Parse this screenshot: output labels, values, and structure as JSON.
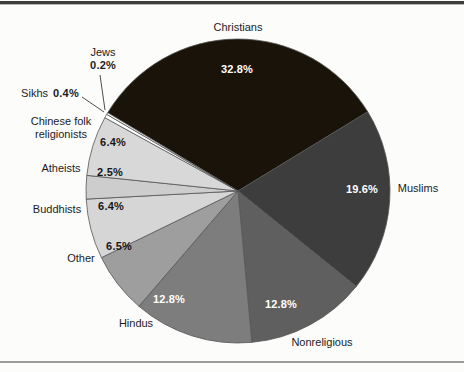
{
  "figure": {
    "background_color": "#fcfcfb",
    "top_rule_color": "#3d3d3d",
    "bottom_rule_color": "#9c9c9c"
  },
  "chart_data": {
    "type": "pie",
    "title": "",
    "unit": "percent",
    "direction": "clockwise",
    "start_angle_deg": -59,
    "legend_position": "outside-labels",
    "slices": [
      {
        "name": "Christians",
        "value": 32.8,
        "pct_label": "32.8%",
        "color": "#1a1309",
        "label_color": "#ffffff"
      },
      {
        "name": "Muslims",
        "value": 19.6,
        "pct_label": "19.6%",
        "color": "#3d3d3d",
        "label_color": "#ffffff"
      },
      {
        "name": "Nonreligious",
        "value": 12.8,
        "pct_label": "12.8%",
        "color": "#5f5f5f",
        "label_color": "#ffffff"
      },
      {
        "name": "Hindus",
        "value": 12.8,
        "pct_label": "12.8%",
        "color": "#7d7d7d",
        "label_color": "#ffffff"
      },
      {
        "name": "Other",
        "value": 6.5,
        "pct_label": "6.5%",
        "color": "#9e9e9e",
        "label_color": "#161616"
      },
      {
        "name": "Buddhists",
        "value": 6.4,
        "pct_label": "6.4%",
        "color": "#d6d6d6",
        "label_color": "#161616"
      },
      {
        "name": "Atheists",
        "value": 2.5,
        "pct_label": "2.5%",
        "color": "#cdcdcd",
        "label_color": "#161616"
      },
      {
        "name": "Chinese folk religionists",
        "value": 6.4,
        "pct_label": "6.4%",
        "color": "#d8d8d8",
        "label_color": "#161616"
      },
      {
        "name": "Sikhs",
        "value": 0.4,
        "pct_label": "0.4%",
        "color": "#ffffff",
        "label_color": "#161616"
      },
      {
        "name": "Jews",
        "value": 0.2,
        "pct_label": "0.2%",
        "color": "#ffffff",
        "label_color": "#161616"
      }
    ]
  },
  "labels": {
    "chinese_folk_line1": "Chinese folk",
    "chinese_folk_line2": "religionists"
  }
}
